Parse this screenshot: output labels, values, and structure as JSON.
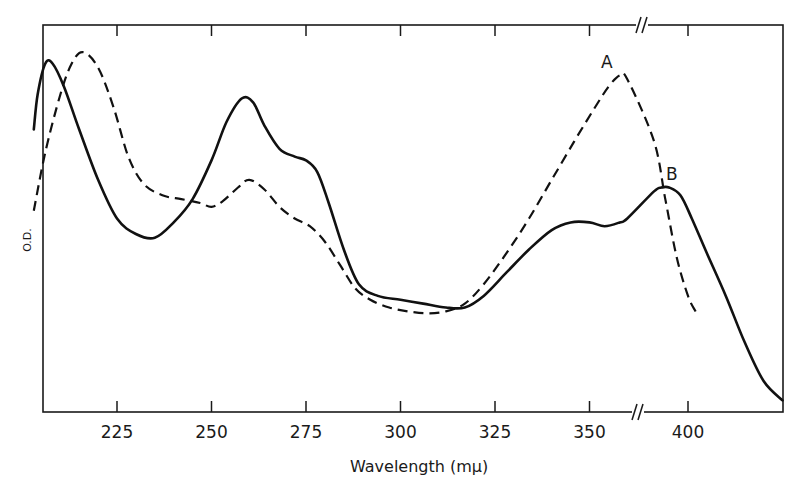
{
  "chart_data": {
    "type": "line",
    "title": "",
    "xlabel": "Wavelength (mμ)",
    "ylabel": "O.D.",
    "xlim": [
      203,
      425
    ],
    "x_axis_break": {
      "between": [
        360,
        390
      ],
      "symbol": "//"
    },
    "ylim": "unlabeled (relative optical density)",
    "grid": false,
    "legend": "none (curves labeled inline A and B)",
    "x_ticks": [
      225,
      250,
      275,
      300,
      325,
      350,
      400
    ],
    "x_tick_labels": [
      "225",
      "250",
      "275",
      "300",
      "325",
      "350",
      "400"
    ],
    "series": [
      {
        "name": "A",
        "style": "dashed",
        "label_position": {
          "x": 607,
          "y": 68
        },
        "x": [
          203,
          206,
          210,
          213,
          216,
          220,
          224,
          228,
          232,
          237,
          242,
          247,
          250,
          253,
          257,
          260,
          264,
          268,
          272,
          276,
          280,
          284,
          288,
          292,
          297,
          302,
          307,
          312,
          317,
          322,
          328,
          334,
          340,
          346,
          351,
          355,
          358,
          360,
          391,
          394,
          397,
          400,
          402
        ],
        "y_relative": [
          0.52,
          0.67,
          0.82,
          0.9,
          0.93,
          0.89,
          0.79,
          0.66,
          0.59,
          0.56,
          0.55,
          0.54,
          0.53,
          0.545,
          0.58,
          0.6,
          0.575,
          0.53,
          0.5,
          0.48,
          0.44,
          0.38,
          0.32,
          0.29,
          0.27,
          0.26,
          0.255,
          0.26,
          0.28,
          0.33,
          0.41,
          0.5,
          0.6,
          0.7,
          0.78,
          0.84,
          0.87,
          0.86,
          0.7,
          0.55,
          0.4,
          0.3,
          0.26
        ]
      },
      {
        "name": "B",
        "style": "solid",
        "label_position": {
          "x": 668,
          "y": 180
        },
        "x": [
          203,
          204,
          206,
          208,
          211,
          215,
          220,
          225,
          230,
          235,
          240,
          245,
          250,
          254,
          258,
          261,
          264,
          268,
          272,
          275,
          278,
          281,
          285,
          289,
          294,
          300,
          306,
          312,
          317,
          322,
          328,
          334,
          340,
          345,
          350,
          354,
          358,
          360,
          391,
          393,
          395,
          398,
          401,
          405,
          410,
          415,
          420,
          425
        ],
        "y_relative": [
          0.73,
          0.82,
          0.9,
          0.9,
          0.84,
          0.73,
          0.6,
          0.5,
          0.46,
          0.45,
          0.49,
          0.55,
          0.65,
          0.75,
          0.81,
          0.8,
          0.74,
          0.68,
          0.66,
          0.65,
          0.62,
          0.54,
          0.42,
          0.33,
          0.3,
          0.29,
          0.28,
          0.27,
          0.27,
          0.3,
          0.36,
          0.42,
          0.47,
          0.49,
          0.49,
          0.48,
          0.49,
          0.5,
          0.57,
          0.58,
          0.58,
          0.56,
          0.5,
          0.41,
          0.3,
          0.18,
          0.08,
          0.03
        ]
      }
    ]
  },
  "labels": {
    "xlabel": "Wavelength (mμ)",
    "ylabel": "O.D.",
    "curve_a": "A",
    "curve_b": "B",
    "ticks": [
      "225",
      "250",
      "275",
      "300",
      "325",
      "350",
      "400"
    ]
  }
}
